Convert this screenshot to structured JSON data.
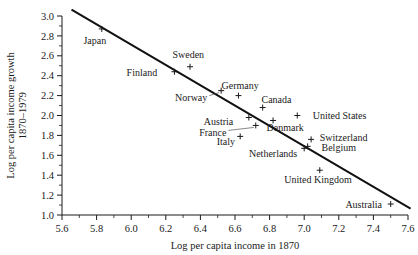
{
  "chart_data": {
    "type": "scatter",
    "title": "",
    "xlabel": "Log per capita income in 1870",
    "ylabel": "Log per capita income growth 1870–1979",
    "xlim": [
      5.6,
      7.6
    ],
    "ylim": [
      1.0,
      3.0
    ],
    "xticks": [
      "5.6",
      "5.8",
      "6.0",
      "6.2",
      "6.4",
      "6.6",
      "6.8",
      "7.0",
      "7.2",
      "7.4",
      "7.6"
    ],
    "yticks": [
      "1.0",
      "1.2",
      "1.4",
      "1.6",
      "1.8",
      "2.0",
      "2.2",
      "2.4",
      "2.6",
      "2.8",
      "3.0"
    ],
    "xtick_step": 0.2,
    "ytick_step": 0.2,
    "minor_ticks": true,
    "grid": false,
    "legend": "none",
    "marker_style": "plus",
    "points": [
      {
        "label": "Japan",
        "x": 5.83,
        "y": 2.87,
        "lx": 5.79,
        "ly": 2.75,
        "anchor": "middle",
        "leader": false
      },
      {
        "label": "Sweden",
        "x": 6.34,
        "y": 2.49,
        "lx": 6.33,
        "ly": 2.61,
        "anchor": "middle",
        "leader": false
      },
      {
        "label": "Finland",
        "x": 6.25,
        "y": 2.44,
        "lx": 6.15,
        "ly": 2.43,
        "anchor": "end",
        "leader": false
      },
      {
        "label": "Norway",
        "x": 6.52,
        "y": 2.25,
        "lx": 6.44,
        "ly": 2.18,
        "anchor": "end",
        "leader": true
      },
      {
        "label": "Germany",
        "x": 6.62,
        "y": 2.2,
        "lx": 6.63,
        "ly": 2.3,
        "anchor": "middle",
        "leader": false
      },
      {
        "label": "Canada",
        "x": 6.76,
        "y": 2.08,
        "lx": 6.84,
        "ly": 2.16,
        "anchor": "middle",
        "leader": false
      },
      {
        "label": "United States",
        "x": 6.96,
        "y": 2.0,
        "lx": 7.05,
        "ly": 2.0,
        "anchor": "start",
        "leader": false
      },
      {
        "label": "Austria",
        "x": 6.68,
        "y": 1.98,
        "lx": 6.59,
        "ly": 1.94,
        "anchor": "end",
        "leader": false
      },
      {
        "label": "Denmark",
        "x": 6.82,
        "y": 1.95,
        "lx": 6.89,
        "ly": 1.88,
        "anchor": "middle",
        "leader": false
      },
      {
        "label": "France",
        "x": 6.72,
        "y": 1.9,
        "lx": 6.55,
        "ly": 1.83,
        "anchor": "end",
        "leader": true
      },
      {
        "label": "Italy",
        "x": 6.63,
        "y": 1.79,
        "lx": 6.6,
        "ly": 1.74,
        "anchor": "end",
        "leader": false
      },
      {
        "label": "Switzerland",
        "x": 7.04,
        "y": 1.76,
        "lx": 7.09,
        "ly": 1.78,
        "anchor": "start",
        "leader": false
      },
      {
        "label": "Belgium",
        "x": 7.02,
        "y": 1.69,
        "lx": 7.1,
        "ly": 1.68,
        "anchor": "start",
        "leader": false
      },
      {
        "label": "Netherlands",
        "x": 7.0,
        "y": 1.67,
        "lx": 6.96,
        "ly": 1.62,
        "anchor": "end",
        "leader": false
      },
      {
        "label": "United Kingdom",
        "x": 7.09,
        "y": 1.45,
        "lx": 7.08,
        "ly": 1.36,
        "anchor": "middle",
        "leader": false
      },
      {
        "label": "Australia",
        "x": 7.5,
        "y": 1.11,
        "lx": 7.45,
        "ly": 1.11,
        "anchor": "end",
        "leader": false
      }
    ],
    "fit_line": {
      "x1": 5.66,
      "y1": 3.06,
      "x2": 7.61,
      "y2": 1.07
    }
  }
}
